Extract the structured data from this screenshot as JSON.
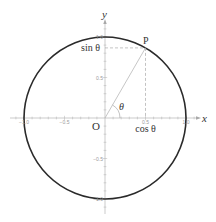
{
  "diagram": {
    "origin_px": [
      105,
      118
    ],
    "radius_px": 81,
    "angle_deg": 60,
    "colors": {
      "circle": "#2a2a2a",
      "axis": "#a8a8a8",
      "radius_line": "#b8b8b8",
      "dashed": "#9a9a9a",
      "text": "#333333",
      "tick_text": "#9a9a9a"
    },
    "labels": {
      "x_axis": "x",
      "y_axis": "y",
      "origin": "O",
      "point": "P",
      "angle": "θ",
      "sin": "sin θ",
      "cos": "cos θ"
    },
    "x_ticks": [
      {
        "value": -1.0,
        "label": "−1.0"
      },
      {
        "value": -0.5,
        "label": "−0.5"
      },
      {
        "value": 0.5,
        "label": "0.5"
      },
      {
        "value": 1.0,
        "label": "1.0"
      }
    ],
    "y_ticks": [
      {
        "value": 1.0,
        "label": "1.0"
      },
      {
        "value": 0.5,
        "label": "0.5"
      },
      {
        "value": -0.5,
        "label": "−0.5"
      },
      {
        "value": -1.0,
        "label": "−1.0"
      }
    ],
    "x_range": [
      -1.2,
      1.2
    ],
    "y_range": [
      -1.2,
      1.2
    ]
  }
}
